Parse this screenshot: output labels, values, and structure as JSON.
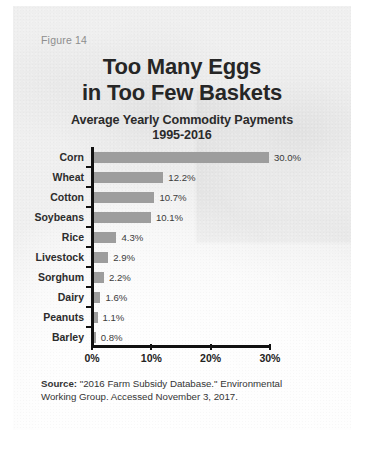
{
  "figure": {
    "number_label": "Figure 14",
    "title_line_1": "Too Many Eggs",
    "title_line_2": "in Too Few Baskets",
    "subtitle_line_1": "Average Yearly Commodity Payments",
    "subtitle_line_2": "1995-2016"
  },
  "source": {
    "label": "Source:",
    "text_line_1": " \"2016 Farm Subsidy Database.\" Environmental",
    "text_line_2": "Working Group. Accessed November 3, 2017."
  },
  "colors": {
    "bar": "#9d9d9d",
    "axis": "#111111",
    "title_text": "#262626",
    "figure_number_text": "#8d8d8d",
    "card_background": "#efefef"
  },
  "chart_data": {
    "type": "bar",
    "orientation": "horizontal",
    "title": "Too Many Eggs in Too Few Baskets",
    "subtitle": "Average Yearly Commodity Payments 1995-2016",
    "xlabel": "",
    "ylabel": "",
    "xlim": [
      0,
      30
    ],
    "grid": false,
    "legend": "none",
    "xtick_labels": [
      "0%",
      "10%",
      "20%",
      "30%"
    ],
    "xtick_values": [
      0,
      10,
      20,
      30
    ],
    "categories": [
      "Corn",
      "Wheat",
      "Cotton",
      "Soybeans",
      "Rice",
      "Livestock",
      "Sorghum",
      "Dairy",
      "Peanuts",
      "Barley"
    ],
    "values": [
      30.0,
      12.2,
      10.7,
      10.1,
      4.3,
      2.9,
      2.2,
      1.6,
      1.1,
      0.8
    ],
    "value_labels": [
      "30.0%",
      "12.2%",
      "10.7%",
      "10.1%",
      "4.3%",
      "2.9%",
      "2.2%",
      "1.6%",
      "1.1%",
      "0.8%"
    ]
  }
}
